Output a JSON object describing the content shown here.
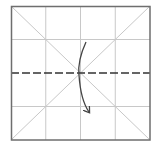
{
  "diagram": {
    "type": "origami-fold-step",
    "paper": {
      "x": 11,
      "y": 6,
      "width": 139,
      "height": 134,
      "border_color": "#6e6e6e"
    },
    "grid": {
      "divisions": 4,
      "color": "#c8c8c8"
    },
    "diagonals": {
      "color": "#c8c8c8"
    },
    "valley_fold": {
      "orientation": "horizontal",
      "position": "middle",
      "style": "dashed",
      "color": "#333333"
    },
    "arrow": {
      "direction": "fold top edge down to bottom",
      "color": "#444444"
    }
  }
}
